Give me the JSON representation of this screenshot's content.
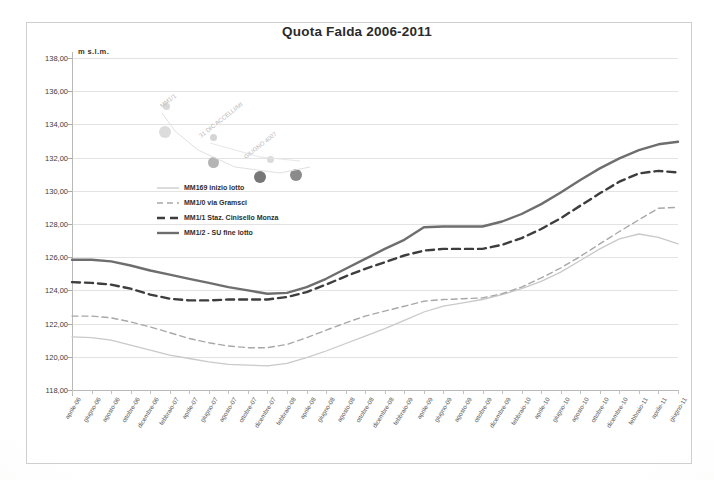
{
  "chart_data": {
    "type": "line",
    "title": "Quota Falda 2006-2011",
    "xlabel": "",
    "ylabel": "m s.l.m.",
    "ylim": [
      118.0,
      138.0
    ],
    "ytick_step": 2.0,
    "ytick_labels": [
      "138,00",
      "136,00",
      "134,00",
      "132,00",
      "130,00",
      "128,00",
      "126,00",
      "124,00",
      "122,00",
      "120,00",
      "118,00"
    ],
    "ytick_values": [
      138.0,
      136.0,
      134.0,
      132.0,
      130.0,
      128.0,
      126.0,
      124.0,
      122.0,
      120.0,
      118.0
    ],
    "grid": true,
    "legend_position": "inside-upper-left",
    "categories": [
      "aprile-06",
      "giugno-06",
      "agosto-06",
      "ottobre-06",
      "dicembre-06",
      "febbraio-07",
      "aprile-07",
      "giugno-07",
      "agosto-07",
      "ottobre-07",
      "dicembre-07",
      "febbraio-08",
      "aprile-08",
      "giugno-08",
      "agosto-08",
      "ottobre-08",
      "dicembre-08",
      "febbraio-09",
      "aprile-09",
      "giugno-09",
      "agosto-09",
      "ottobre-09",
      "dicembre-09",
      "febbraio-10",
      "aprile-10",
      "giugno-10",
      "agosto-10",
      "ottobre-10",
      "dicembre-10",
      "febbraio-11",
      "aprile-11",
      "giugno-11"
    ],
    "series": [
      {
        "name": "MM169 inizio lotto",
        "style": "solid-light",
        "color": "#c9c9c9",
        "values": [
          121.2,
          121.15,
          121.0,
          120.7,
          120.4,
          120.1,
          119.9,
          119.7,
          119.55,
          119.5,
          119.45,
          119.6,
          119.95,
          120.35,
          120.8,
          121.25,
          121.7,
          122.2,
          122.7,
          123.05,
          123.25,
          123.45,
          123.75,
          124.1,
          124.55,
          125.1,
          125.8,
          126.5,
          127.1,
          127.4,
          127.2,
          126.8
        ]
      },
      {
        "name": "MM1/0 via Gramsci",
        "style": "dashed-light",
        "color": "#a8a8a8",
        "values": [
          122.45,
          122.45,
          122.35,
          122.1,
          121.8,
          121.45,
          121.1,
          120.85,
          120.65,
          120.55,
          120.55,
          120.75,
          121.15,
          121.6,
          122.05,
          122.45,
          122.75,
          123.05,
          123.35,
          123.45,
          123.5,
          123.55,
          123.8,
          124.2,
          124.75,
          125.35,
          126.05,
          126.8,
          127.55,
          128.25,
          128.95,
          129.0
        ]
      },
      {
        "name": "MM1/1 Staz. Cinisello Monza",
        "style": "dashed-dark",
        "color": "#3d3d3d",
        "values": [
          124.5,
          124.45,
          124.35,
          124.1,
          123.75,
          123.5,
          123.4,
          123.4,
          123.45,
          123.45,
          123.45,
          123.6,
          123.9,
          124.35,
          124.85,
          125.3,
          125.7,
          126.1,
          126.4,
          126.5,
          126.5,
          126.5,
          126.75,
          127.15,
          127.7,
          128.35,
          129.1,
          129.85,
          130.55,
          131.05,
          131.2,
          131.1
        ]
      },
      {
        "name": "MM1/2 - SU fine lotto",
        "style": "solid-dark",
        "color": "#6e6e6e",
        "values": [
          125.85,
          125.85,
          125.75,
          125.5,
          125.2,
          124.95,
          124.7,
          124.45,
          124.2,
          124.0,
          123.8,
          123.85,
          124.2,
          124.7,
          125.3,
          125.9,
          126.5,
          127.05,
          127.8,
          127.85,
          127.85,
          127.85,
          128.15,
          128.6,
          129.2,
          129.9,
          130.65,
          131.35,
          131.95,
          132.45,
          132.8,
          132.95
        ]
      }
    ]
  },
  "legend": {
    "items": [
      {
        "label": "MM169 inizio lotto"
      },
      {
        "label": "MM1/0 via Gramsci"
      },
      {
        "label": "MM1/1 Staz. Cinisello Monza"
      },
      {
        "label": "MM1/2 - SU fine lotto"
      }
    ]
  },
  "annotations": {
    "faint_notes": [
      "MM1/1",
      "31 DIC ACCELLI/MI",
      "GIUGNO 4007"
    ]
  }
}
